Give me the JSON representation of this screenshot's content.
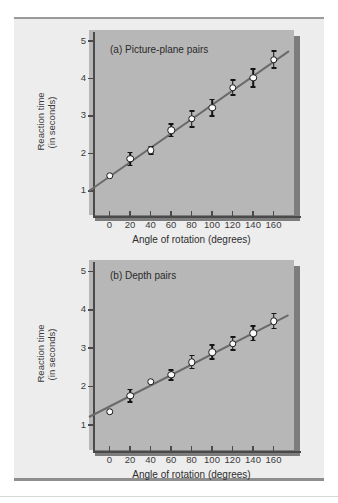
{
  "figure": {
    "background_color": "#ededed",
    "panel_color": "#b7b7b7",
    "shadow_color": "#7d7d7d",
    "line_color": "#6a6a6a",
    "marker_fill": "#fbfbfb",
    "marker_edge": "#1c1c1c"
  },
  "chart_data": [
    {
      "type": "scatter",
      "id": "picture-plane",
      "title": "(a)  Picture-plane pairs",
      "title_label": "(a)",
      "title_text": "Picture-plane pairs",
      "xlabel": "Angle of rotation (degrees)",
      "ylabel_line1": "Reaction time",
      "ylabel_line2": "(in seconds)",
      "xlim": [
        -20,
        180
      ],
      "ylim": [
        0.35,
        5.3
      ],
      "xticks": [
        0,
        20,
        40,
        60,
        80,
        100,
        120,
        140,
        160
      ],
      "xtick_labels": [
        "0",
        "20",
        "40",
        "60",
        "80",
        "100",
        "120",
        "140",
        "160"
      ],
      "yticks": [
        1,
        2,
        3,
        4,
        5
      ],
      "ytick_labels": [
        "1",
        "2",
        "3",
        "4",
        "5"
      ],
      "grid": false,
      "legend": "none",
      "x": [
        0,
        20,
        40,
        60,
        80,
        100,
        120,
        140,
        160
      ],
      "values": [
        1.4,
        1.85,
        2.08,
        2.62,
        2.92,
        3.22,
        3.76,
        4.02,
        4.51
      ],
      "error": [
        0.0,
        0.17,
        0.1,
        0.17,
        0.21,
        0.22,
        0.2,
        0.24,
        0.23
      ],
      "fit_line": {
        "x0": -20,
        "y0": 0.98,
        "x1": 175,
        "y1": 4.72
      }
    },
    {
      "type": "scatter",
      "id": "depth",
      "title": "(b)  Depth pairs",
      "title_label": "(b)",
      "title_text": "Depth pairs",
      "xlabel": "Angle of rotation (degrees)",
      "ylabel_line1": "Reaction time",
      "ylabel_line2": "(in seconds)",
      "xlim": [
        -20,
        180
      ],
      "ylim": [
        0.35,
        5.3
      ],
      "xticks": [
        0,
        20,
        40,
        60,
        80,
        100,
        120,
        140,
        160
      ],
      "xtick_labels": [
        "0",
        "20",
        "40",
        "60",
        "80",
        "100",
        "120",
        "140",
        "160"
      ],
      "yticks": [
        1,
        2,
        3,
        4,
        5
      ],
      "ytick_labels": [
        "1",
        "2",
        "3",
        "4",
        "5"
      ],
      "grid": false,
      "legend": "none",
      "x": [
        0,
        20,
        40,
        60,
        80,
        100,
        120,
        140,
        160
      ],
      "values": [
        1.35,
        1.76,
        2.13,
        2.31,
        2.64,
        2.9,
        3.12,
        3.39,
        3.71
      ],
      "error": [
        0.0,
        0.16,
        0.0,
        0.13,
        0.17,
        0.18,
        0.17,
        0.19,
        0.2
      ],
      "fit_line": {
        "x0": -20,
        "y0": 1.22,
        "x1": 175,
        "y1": 3.88
      }
    }
  ]
}
